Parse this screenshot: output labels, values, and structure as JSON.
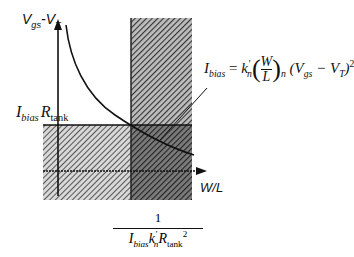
{
  "diagram": {
    "y_axis_label": {
      "main": "V",
      "sub1": "gs",
      "dash": "-",
      "main2": "V",
      "sub2": "T"
    },
    "x_axis_label": "W/L",
    "level_label": {
      "I": "I",
      "I_sub": "bias",
      "R": "R",
      "R_sub": "tank"
    },
    "equation": {
      "lhs": "I",
      "lhs_sub": "bias",
      "eq": "=",
      "k": "k",
      "k_sup": "'",
      "k_sub": "n",
      "frac_num": "W",
      "frac_den": "L",
      "paren_sub": "n",
      "rest": "(V",
      "rest_sub1": "gs",
      "minus": " − V",
      "rest_sub2": "T",
      "close": ")",
      "power": "2"
    },
    "x_threshold_label": {
      "numerator": "1",
      "I": "I",
      "I_sub": "bias",
      "k": "k",
      "k_sup": "'",
      "k_sub": "n",
      "R": "R",
      "R_sub": "tank",
      "power": "2"
    },
    "colors": {
      "hatch_light": "#8a8a8a",
      "hatch_dark": "#3a3a3a",
      "line": "#111111"
    }
  }
}
